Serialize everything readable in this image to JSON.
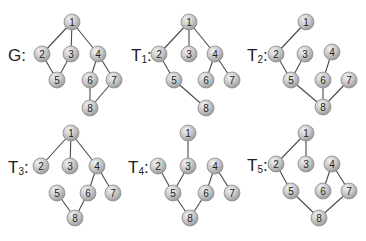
{
  "diagram": {
    "node_radius": 8,
    "colors": {
      "node_fill_light": "#f0f0f0",
      "node_fill_dark": "#a8a8a8",
      "edge": "#4a4a4a",
      "text": "#222222"
    },
    "graphs": [
      {
        "id": "G",
        "label_main": "G",
        "label_sub": "",
        "label_suffix": ":",
        "label_pos": [
          8,
          55
        ],
        "nodes": {
          "1": [
            72,
            22
          ],
          "2": [
            42,
            54
          ],
          "3": [
            71,
            54
          ],
          "4": [
            98,
            54
          ],
          "5": [
            57,
            80
          ],
          "6": [
            90,
            80
          ],
          "7": [
            114,
            80
          ],
          "8": [
            90,
            108
          ]
        },
        "edges": [
          [
            "1",
            "2"
          ],
          [
            "1",
            "3"
          ],
          [
            "1",
            "4"
          ],
          [
            "2",
            "5"
          ],
          [
            "3",
            "5"
          ],
          [
            "4",
            "6"
          ],
          [
            "4",
            "7"
          ],
          [
            "6",
            "8"
          ],
          [
            "7",
            "8"
          ]
        ]
      },
      {
        "id": "T1",
        "label_main": "T",
        "label_sub": "1",
        "label_suffix": ":",
        "label_pos": [
          131,
          55
        ],
        "nodes": {
          "1": [
            189,
            22
          ],
          "2": [
            159,
            54
          ],
          "3": [
            189,
            54
          ],
          "4": [
            215,
            54
          ],
          "5": [
            174,
            80
          ],
          "6": [
            206,
            80
          ],
          "7": [
            232,
            80
          ],
          "8": [
            206,
            108
          ]
        },
        "edges": [
          [
            "1",
            "2"
          ],
          [
            "1",
            "3"
          ],
          [
            "1",
            "4"
          ],
          [
            "2",
            "5"
          ],
          [
            "5",
            "8"
          ],
          [
            "4",
            "6"
          ],
          [
            "4",
            "7"
          ]
        ]
      },
      {
        "id": "T2",
        "label_main": "T",
        "label_sub": "2",
        "label_suffix": ":",
        "label_pos": [
          247,
          55
        ],
        "nodes": {
          "1": [
            306,
            22
          ],
          "2": [
            276,
            54
          ],
          "3": [
            305,
            54
          ],
          "4": [
            332,
            52
          ],
          "5": [
            291,
            80
          ],
          "6": [
            323,
            80
          ],
          "7": [
            349,
            80
          ],
          "8": [
            323,
            107
          ]
        },
        "edges": [
          [
            "1",
            "2"
          ],
          [
            "2",
            "5"
          ],
          [
            "3",
            "5"
          ],
          [
            "5",
            "8"
          ],
          [
            "4",
            "6"
          ],
          [
            "6",
            "8"
          ],
          [
            "7",
            "8"
          ]
        ]
      },
      {
        "id": "T3",
        "label_main": "T",
        "label_sub": "3",
        "label_suffix": ":",
        "label_pos": [
          8,
          167
        ],
        "nodes": {
          "1": [
            71,
            133
          ],
          "2": [
            41,
            166
          ],
          "3": [
            70,
            166
          ],
          "4": [
            97,
            166
          ],
          "5": [
            57,
            193
          ],
          "6": [
            88,
            193
          ],
          "7": [
            113,
            193
          ],
          "8": [
            75,
            218
          ]
        },
        "edges": [
          [
            "1",
            "2"
          ],
          [
            "1",
            "3"
          ],
          [
            "1",
            "4"
          ],
          [
            "4",
            "6"
          ],
          [
            "4",
            "7"
          ],
          [
            "6",
            "8"
          ],
          [
            "5",
            "8"
          ]
        ]
      },
      {
        "id": "T4",
        "label_main": "T",
        "label_sub": "4",
        "label_suffix": ":",
        "label_pos": [
          128,
          167
        ],
        "nodes": {
          "1": [
            188,
            133
          ],
          "2": [
            158,
            166
          ],
          "3": [
            188,
            166
          ],
          "4": [
            215,
            166
          ],
          "5": [
            173,
            193
          ],
          "6": [
            206,
            193
          ],
          "7": [
            232,
            193
          ],
          "8": [
            190,
            218
          ]
        },
        "edges": [
          [
            "1",
            "3"
          ],
          [
            "3",
            "5"
          ],
          [
            "2",
            "5"
          ],
          [
            "5",
            "8"
          ],
          [
            "6",
            "8"
          ],
          [
            "4",
            "6"
          ],
          [
            "4",
            "7"
          ]
        ]
      },
      {
        "id": "T5",
        "label_main": "T",
        "label_sub": "5",
        "label_suffix": ":",
        "label_pos": [
          247,
          165
        ],
        "nodes": {
          "1": [
            306,
            133
          ],
          "2": [
            276,
            164
          ],
          "3": [
            306,
            164
          ],
          "4": [
            332,
            164
          ],
          "5": [
            291,
            191
          ],
          "6": [
            323,
            191
          ],
          "7": [
            349,
            191
          ],
          "8": [
            319,
            218
          ]
        },
        "edges": [
          [
            "1",
            "2"
          ],
          [
            "1",
            "3"
          ],
          [
            "2",
            "5"
          ],
          [
            "5",
            "8"
          ],
          [
            "7",
            "8"
          ],
          [
            "4",
            "7"
          ],
          [
            "4",
            "6"
          ]
        ]
      }
    ]
  }
}
